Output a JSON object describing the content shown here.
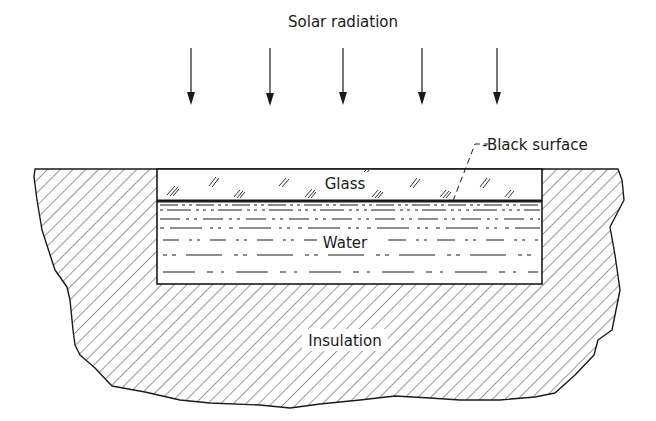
{
  "labels": {
    "solar_radiation": "Solar radiation",
    "black_surface": "-Black surface",
    "glass": "Glass",
    "water": "Water",
    "insulation": "Insulation"
  },
  "arrows": {
    "count": 5,
    "x_positions": [
      191,
      270,
      343,
      422,
      497
    ],
    "y_start": 48,
    "y_end": 105
  },
  "colors": {
    "ink": "#1a1a1a",
    "background": "#ffffff"
  }
}
